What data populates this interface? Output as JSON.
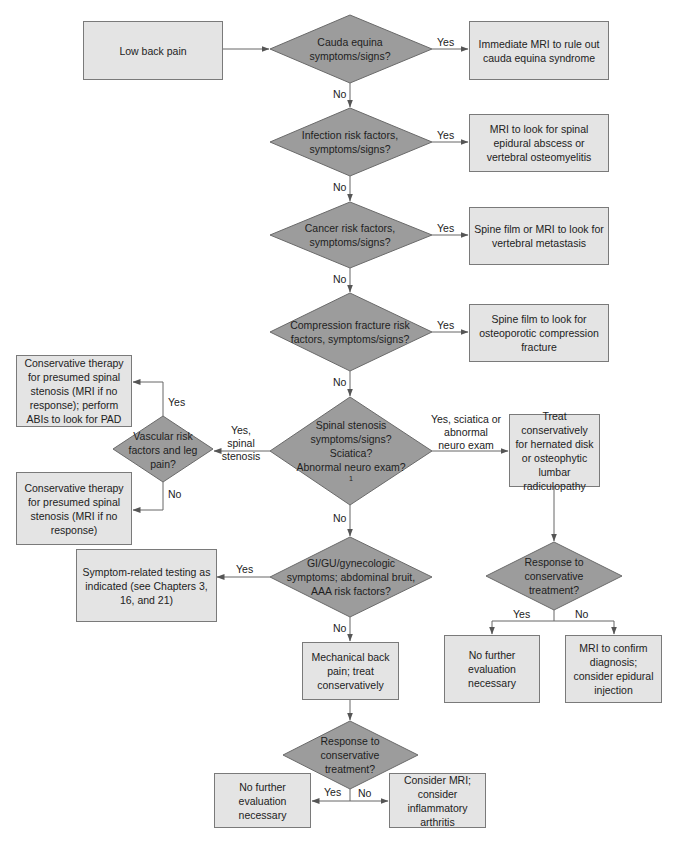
{
  "colors": {
    "box_fill": "#e4e4e4",
    "diamond_fill": "#9c9c9c",
    "stroke": "#666666",
    "text": "#222222"
  },
  "start": {
    "label": "Low back pain"
  },
  "decisions": {
    "cauda": {
      "label": "Cauda equina symptoms/signs?",
      "yes": "Yes",
      "no": "No"
    },
    "infection": {
      "label": "Infection risk factors, symptoms/signs?",
      "yes": "Yes",
      "no": "No"
    },
    "cancer": {
      "label": "Cancer risk factors, symptoms/signs?",
      "yes": "Yes",
      "no": "No"
    },
    "compression": {
      "label": "Compression fracture risk factors, symptoms/signs?",
      "yes": "Yes",
      "no": "No"
    },
    "stenosis": {
      "label_line1": "Spinal stenosis symptoms/signs?",
      "label_line2": "Sciatica?",
      "label_line3": "Abnormal neuro exam?",
      "footnote": "1",
      "left": "Yes, spinal stenosis",
      "right": "Yes, sciatica or abnormal neuro exam",
      "no": "No"
    },
    "vascular": {
      "label": "Vascular risk factors and leg pain?",
      "yes": "Yes",
      "no": "No"
    },
    "gi": {
      "label": "GI/GU/gynecologic symptoms; abdominal bruit, AAA risk factors?",
      "yes": "Yes",
      "no": "No"
    },
    "response_right": {
      "label": "Response to conservative treatment?",
      "yes": "Yes",
      "no": "No"
    },
    "response_bottom": {
      "label": "Response to conservative treatment?",
      "yes": "Yes",
      "no": "No"
    }
  },
  "outcomes": {
    "cauda_mri": "Immediate MRI to rule out cauda equina syndrome",
    "infection_mri": "MRI to look for spinal epidural abscess or vertebral osteomyelitis",
    "cancer_film": "Spine film or MRI to look for vertebral metastasis",
    "compression_film": "Spine film to look for osteoporotic compression fracture",
    "vascular_yes": "Conservative therapy for presumed spinal stenosis (MRI if no response); perform ABIs to look for PAD",
    "vascular_no": "Conservative therapy for presumed spinal stenosis (MRI if no response)",
    "treat_disk": "Treat conservatively for hernated disk or osteophytic lumbar radiculopathy",
    "symptom_testing": "Symptom-related testing as indicated (see Chapters 3, 16, and 21)",
    "mechanical": "Mechanical back pain; treat conservatively",
    "right_no_further": "No further evaluation necessary",
    "right_mri": "MRI to confirm diagnosis; consider epidural injection",
    "bottom_no_further": "No further evaluation necessary",
    "bottom_mri": "Consider MRI; consider inflammatory arthritis"
  }
}
